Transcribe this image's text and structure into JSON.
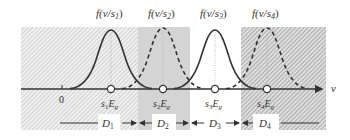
{
  "diagram": {
    "axis": {
      "label": "v",
      "zero_label": "0"
    },
    "curves": [
      {
        "id": "s1",
        "title": "f(v/s",
        "sub": "1",
        "close": ")",
        "style": "solid",
        "center_label": "s",
        "center_sub": "1",
        "center_tail": "E",
        "center_tail_sub": "g"
      },
      {
        "id": "s2",
        "title": "f(v/s",
        "sub": "2",
        "close": ")",
        "style": "dashed",
        "center_label": "s",
        "center_sub": "2",
        "center_tail": "E",
        "center_tail_sub": "g"
      },
      {
        "id": "s3",
        "title": "f(v/s",
        "sub": "3",
        "close": ")",
        "style": "solid",
        "center_label": "s",
        "center_sub": "3",
        "center_tail": "E",
        "center_tail_sub": "g"
      },
      {
        "id": "s4",
        "title": "f(v/s",
        "sub": "4",
        "close": ")",
        "style": "dashed",
        "center_label": "s",
        "center_sub": "4",
        "center_tail": "E",
        "center_tail_sub": "g"
      }
    ],
    "regions": [
      {
        "id": "D1",
        "label": "D",
        "sub": "1",
        "fill": "hatched-light"
      },
      {
        "id": "D2",
        "label": "D",
        "sub": "2",
        "fill": "solid-grey"
      },
      {
        "id": "D3",
        "label": "D",
        "sub": "3",
        "fill": "white"
      },
      {
        "id": "D4",
        "label": "D",
        "sub": "4",
        "fill": "hatched-dark"
      }
    ],
    "colors": {
      "line": "#333333",
      "hatch_light": "#c8c8c8",
      "hatch_dark": "#9a9a9a",
      "grey_fill": "#d4d4d4",
      "guide": "#aaaaaa"
    }
  }
}
